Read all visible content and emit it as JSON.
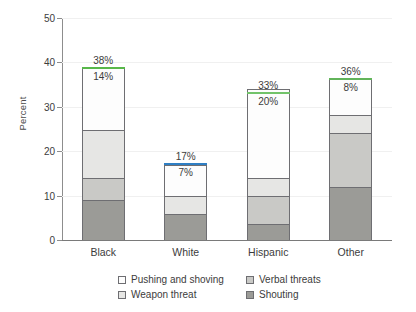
{
  "chart_data": {
    "type": "bar",
    "subtype": "stacked-vertical",
    "title": "",
    "xlabel": "",
    "ylabel": "Percent",
    "ylim": [
      0,
      50
    ],
    "yticks": [
      0,
      10,
      20,
      30,
      40,
      50
    ],
    "ytick_labels": [
      "0",
      "10",
      "20",
      "30",
      "40",
      "50"
    ],
    "grid": true,
    "legend_position": "bottom",
    "categories": [
      "Black",
      "White",
      "Hispanic",
      "Other"
    ],
    "series": [
      {
        "name": "Shouting",
        "color": "#9b9b97",
        "values": [
          9.0,
          5.8,
          3.6,
          12.0
        ]
      },
      {
        "name": "Verbal threats",
        "color": "#c9c9c6",
        "values": [
          5.0,
          0.0,
          6.4,
          12.0
        ]
      },
      {
        "name": "Weapon threat",
        "color": "#e6e6e4",
        "values": [
          10.8,
          4.2,
          4.0,
          4.2
        ]
      },
      {
        "name": "Pushing and shoving",
        "color": "#fdfdfd",
        "values": [
          14.0,
          7.0,
          20.0,
          8.0
        ]
      }
    ],
    "totals": [
      38.7,
      17.1,
      33.2,
      36.2
    ],
    "annotations": {
      "total_labels": [
        "38%",
        "17%",
        "33%",
        "36%"
      ],
      "pushing_labels": [
        "14%",
        "7%",
        "20%",
        "8%"
      ]
    }
  },
  "legend": {
    "entries": [
      {
        "label": "Pushing and shoving",
        "swatch": "#fdfdfd"
      },
      {
        "label": "Verbal threats",
        "swatch": "#c9c9c6"
      },
      {
        "label": "Weapon threat",
        "swatch": "#e6e6e4"
      },
      {
        "label": "Shouting",
        "swatch": "#9b9b97"
      }
    ]
  },
  "axis": {
    "y_title": "Percent"
  }
}
